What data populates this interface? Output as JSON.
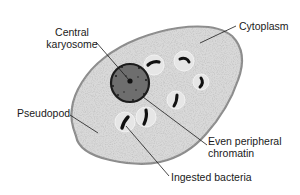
{
  "diagram": {
    "colors": {
      "cytoplasm_fill": "#d9d9d9",
      "cell_outline": "#8c8c8c",
      "nucleus_fill": "#6e6e6e",
      "nucleus_rim": "#1c1c1c",
      "karyosome": "#111111",
      "bacteria": "#111111",
      "vacuole_outline": "#eeeeee",
      "leader_line": "#1a1a1a",
      "text": "#1a1a1a"
    },
    "labels": {
      "central_karyosome": [
        "Central",
        "karyosome"
      ],
      "cytoplasm": "Cytoplasm",
      "pseudopod": "Pseudopod",
      "even_peripheral_chromatin": [
        "Even peripheral",
        "chromatin"
      ],
      "ingested_bacteria": "Ingested bacteria"
    }
  }
}
